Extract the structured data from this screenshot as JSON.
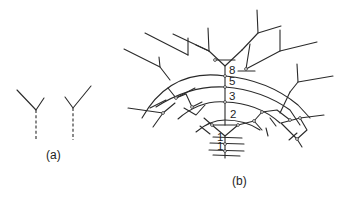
{
  "figure": {
    "panel_a": {
      "label": "(a)"
    },
    "panel_b": {
      "label": "(b)",
      "order_labels": [
        "8",
        "5",
        "3",
        "2",
        "1",
        "1"
      ]
    }
  },
  "colors": {
    "line": "#2a2a2a",
    "background": "#ffffff"
  }
}
